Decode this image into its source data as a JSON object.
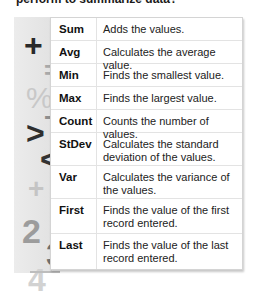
{
  "header": {
    "question_fragment": "perform to summarize data?"
  },
  "decoration": {
    "symbols": [
      "+",
      "=",
      "%",
      "−",
      ">",
      "<",
      "+",
      "-",
      "2",
      "3",
      "4"
    ]
  },
  "functions_table": {
    "rows": [
      {
        "name": "Sum",
        "description": "Adds the values."
      },
      {
        "name": "Avg",
        "description": "Calculates the average value."
      },
      {
        "name": "Min",
        "description": "Finds the smallest value."
      },
      {
        "name": "Max",
        "description": "Finds the largest value."
      },
      {
        "name": "Count",
        "description": "Counts the number of values."
      },
      {
        "name": "StDev",
        "description": "Calculates the standard deviation of the values."
      },
      {
        "name": "Var",
        "description": "Calculates the variance of the values."
      },
      {
        "name": "First",
        "description": "Finds the value of the first record entered."
      },
      {
        "name": "Last",
        "description": "Finds the value of the last record entered."
      }
    ]
  }
}
